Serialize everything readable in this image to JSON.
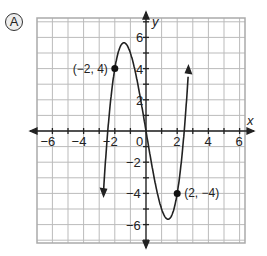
{
  "problem_label": "A",
  "chart_data": {
    "type": "line",
    "title": "",
    "xlabel": "x",
    "ylabel": "y",
    "xlim": [
      -7,
      6.3
    ],
    "ylim": [
      -7.2,
      7.2
    ],
    "grid": true,
    "x_ticks": [
      "-6",
      "-4",
      "-2",
      "0",
      "2",
      "4",
      "6"
    ],
    "y_ticks": [
      "6",
      "4",
      "2",
      "-2",
      "-4",
      "-6"
    ],
    "function": "cubic through (-2,4) and (2,-4), local max ~(-1.5,5.5), local min ~(1.5,-5.5)",
    "points": [
      {
        "x": -2,
        "y": 4,
        "label": "(−2, 4)"
      },
      {
        "x": 2,
        "y": -4,
        "label": "(2, −4)"
      }
    ],
    "series": [
      {
        "name": "f(x)",
        "x": [
          -2.5,
          -2,
          -1.5,
          -1,
          0,
          1,
          1.5,
          2,
          2.5
        ],
        "y": [
          -7,
          4,
          5.5,
          4.5,
          0,
          -4.5,
          -5.5,
          -4,
          7
        ]
      }
    ]
  }
}
